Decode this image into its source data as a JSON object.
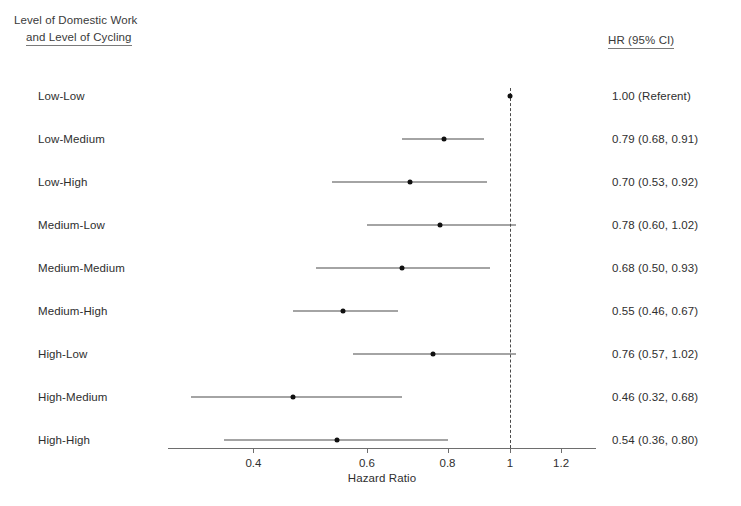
{
  "header": {
    "left_line1": "Level of Domestic Work",
    "left_line2": "and Level of Cycling",
    "right": "HR (95% CI)"
  },
  "axis": {
    "title": "Hazard Ratio",
    "ticks": [
      "0.4",
      "0.6",
      "0.8",
      "1",
      "1.2"
    ],
    "tick_values": [
      0.4,
      0.6,
      0.8,
      1.0,
      1.2
    ],
    "scale": "log",
    "reference_value": 1.0
  },
  "chart_data": {
    "type": "forest",
    "title": "",
    "xlabel": "Hazard Ratio",
    "ylabel": "Level of Domestic Work and Level of Cycling",
    "xscale": "log",
    "xlim": [
      0.3,
      1.3
    ],
    "xticks": [
      0.4,
      0.6,
      0.8,
      1.0,
      1.2
    ],
    "reference_line": 1.0,
    "grid": false,
    "legend": "none",
    "value_column_header": "HR (95% CI)",
    "categories": [
      "Low-Low",
      "Low-Medium",
      "Low-High",
      "Medium-Low",
      "Medium-Medium",
      "Medium-High",
      "High-Low",
      "High-Medium",
      "High-High"
    ],
    "rows": [
      {
        "label": "Low-Low",
        "hr": 1.0,
        "ci_low": null,
        "ci_high": null,
        "value_text": "1.00 (Referent)",
        "referent": true
      },
      {
        "label": "Low-Medium",
        "hr": 0.79,
        "ci_low": 0.68,
        "ci_high": 0.91,
        "value_text": "0.79 (0.68, 0.91)",
        "referent": false
      },
      {
        "label": "Low-High",
        "hr": 0.7,
        "ci_low": 0.53,
        "ci_high": 0.92,
        "value_text": "0.70 (0.53, 0.92)",
        "referent": false
      },
      {
        "label": "Medium-Low",
        "hr": 0.78,
        "ci_low": 0.6,
        "ci_high": 1.02,
        "value_text": "0.78 (0.60, 1.02)",
        "referent": false
      },
      {
        "label": "Medium-Medium",
        "hr": 0.68,
        "ci_low": 0.5,
        "ci_high": 0.93,
        "value_text": "0.68 (0.50, 0.93)",
        "referent": false
      },
      {
        "label": "Medium-High",
        "hr": 0.55,
        "ci_low": 0.46,
        "ci_high": 0.67,
        "value_text": "0.55 (0.46, 0.67)",
        "referent": false
      },
      {
        "label": "High-Low",
        "hr": 0.76,
        "ci_low": 0.57,
        "ci_high": 1.02,
        "value_text": "0.76 (0.57, 1.02)",
        "referent": false
      },
      {
        "label": "High-Medium",
        "hr": 0.46,
        "ci_low": 0.32,
        "ci_high": 0.68,
        "value_text": "0.46 (0.32, 0.68)",
        "referent": false
      },
      {
        "label": "High-High",
        "hr": 0.54,
        "ci_low": 0.36,
        "ci_high": 0.8,
        "value_text": "0.54 (0.36, 0.80)",
        "referent": false
      }
    ]
  },
  "colors": {
    "marker": "#101010",
    "line": "#4a4a4a",
    "axis": "#6e6e6e",
    "text": "#2e2e2e",
    "background": "#ffffff"
  },
  "geometry": {
    "first_row_y": 96,
    "row_spacing": 43,
    "axis_y": 448,
    "axis_left_x": 168,
    "axis_right_x": 596,
    "x_at_hr1": 510,
    "px_per_ln_unit": 280,
    "tick_height": 5,
    "axis_title_y": 472
  }
}
